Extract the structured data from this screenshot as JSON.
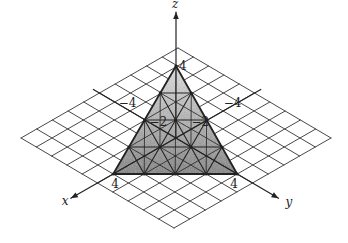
{
  "figure": {
    "type": "3d-plane-diagram",
    "plane_equation": "x + y + z = 4",
    "grid": {
      "min": -5,
      "max": 5,
      "step": 1
    },
    "projection": {
      "origin": [
        176,
        138
      ],
      "x_unit": [
        -15.7,
        9.0
      ],
      "y_unit": [
        15.3,
        9.0
      ],
      "z_unit": [
        0,
        -18.0
      ]
    },
    "triangle": {
      "vertices": {
        "x": [
          4,
          0,
          0
        ],
        "y": [
          0,
          4,
          0
        ],
        "z": [
          0,
          0,
          4
        ]
      },
      "subdivisions": 4,
      "fill_color": "#9a9a9a"
    },
    "axes": {
      "x": {
        "label": "x",
        "from": -5.4,
        "to": 6.7
      },
      "y": {
        "label": "y",
        "from": -5.4,
        "to": 6.7
      },
      "z": {
        "label": "z",
        "from": 0,
        "to": 7.0
      }
    },
    "tick_labels": [
      {
        "text": "4",
        "axis": "z",
        "value": 4
      },
      {
        "text": "−4",
        "axis": "x",
        "value": -4
      },
      {
        "text": "−2",
        "axis": "x",
        "value": -2
      },
      {
        "text": "−4",
        "axis": "y",
        "value": -4
      },
      {
        "text": "−2",
        "axis": "y",
        "value": -2
      },
      {
        "text": "4",
        "axis": "x",
        "value": 4
      },
      {
        "text": "4",
        "axis": "y",
        "value": 4
      }
    ],
    "colors": {
      "line": "#222222",
      "grid": "#333333",
      "background": "#ffffff"
    }
  }
}
